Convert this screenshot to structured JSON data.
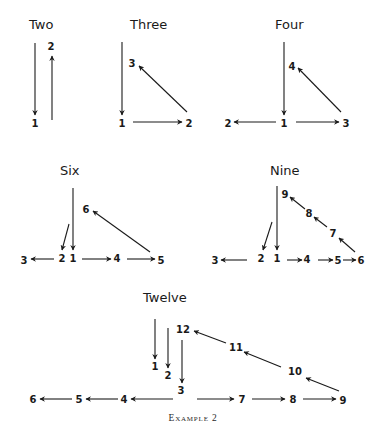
{
  "figure": {
    "caption": "Example 2",
    "ink_color": "#1a1a1a",
    "background": "#ffffff"
  },
  "diagrams": {
    "two": {
      "title": "Two",
      "nodes": {
        "n1": "1",
        "n2": "2"
      }
    },
    "three": {
      "title": "Three",
      "nodes": {
        "n1": "1",
        "n2": "2",
        "n3": "3"
      }
    },
    "four": {
      "title": "Four",
      "nodes": {
        "n1": "1",
        "n2": "2",
        "n3": "3",
        "n4": "4"
      }
    },
    "six": {
      "title": "Six",
      "nodes": {
        "n1": "1",
        "n2": "2",
        "n3": "3",
        "n4": "4",
        "n5": "5",
        "n6": "6"
      }
    },
    "nine": {
      "title": "Nine",
      "nodes": {
        "n1": "1",
        "n2": "2",
        "n3": "3",
        "n4": "4",
        "n5": "5",
        "n6": "6",
        "n7": "7",
        "n8": "8",
        "n9": "9"
      }
    },
    "twelve": {
      "title": "Twelve",
      "nodes": {
        "n1": "1",
        "n2": "2",
        "n3": "3",
        "n4": "4",
        "n5": "5",
        "n6": "6",
        "n7": "7",
        "n8": "8",
        "n9": "9",
        "n10": "10",
        "n11": "11",
        "n12": "12"
      }
    }
  }
}
